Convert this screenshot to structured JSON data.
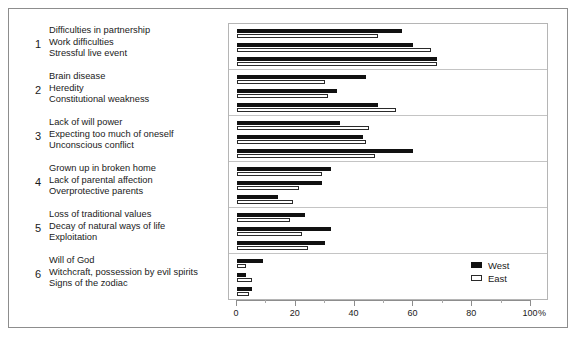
{
  "chart_data": {
    "type": "bar",
    "orientation": "horizontal",
    "title": "",
    "xlabel": "",
    "ylabel": "",
    "unit": "%",
    "xlim": [
      0,
      100
    ],
    "grid": false,
    "legend_position": "inside-bottom-right",
    "tick_labels": [
      "0",
      "20",
      "40",
      "60",
      "80",
      "100"
    ],
    "tick_values": [
      0,
      20,
      40,
      60,
      80,
      100
    ],
    "minor_tick_values": [
      10,
      30,
      50,
      70,
      90
    ],
    "series": [
      {
        "name": "West",
        "color": "#111111",
        "style": "filled"
      },
      {
        "name": "East",
        "color": "#ffffff",
        "style": "outlined"
      }
    ],
    "groups": [
      {
        "number": "1",
        "categories": [
          {
            "label": "Difficulties in partnership",
            "West": 56,
            "East": 48
          },
          {
            "label": "Work difficulties",
            "West": 60,
            "East": 66
          },
          {
            "label": "Stressful live event",
            "West": 68,
            "East": 68
          }
        ]
      },
      {
        "number": "2",
        "categories": [
          {
            "label": "Brain disease",
            "West": 44,
            "East": 30
          },
          {
            "label": "Heredity",
            "West": 34,
            "East": 31
          },
          {
            "label": "Constitutional weakness",
            "West": 48,
            "East": 54
          }
        ]
      },
      {
        "number": "3",
        "categories": [
          {
            "label": "Lack of will power",
            "West": 35,
            "East": 45
          },
          {
            "label": "Expecting too much of oneself",
            "West": 43,
            "East": 44
          },
          {
            "label": "Unconscious conflict",
            "West": 60,
            "East": 47
          }
        ]
      },
      {
        "number": "4",
        "categories": [
          {
            "label": "Grown up in broken home",
            "West": 32,
            "East": 29
          },
          {
            "label": "Lack of parental affection",
            "West": 29,
            "East": 21
          },
          {
            "label": "Overprotective parents",
            "West": 14,
            "East": 19
          }
        ]
      },
      {
        "number": "5",
        "categories": [
          {
            "label": "Loss of traditional values",
            "West": 23,
            "East": 18
          },
          {
            "label": "Decay of natural ways of life",
            "West": 32,
            "East": 22
          },
          {
            "label": "Exploitation",
            "West": 30,
            "East": 24
          }
        ]
      },
      {
        "number": "6",
        "categories": [
          {
            "label": "Will of God",
            "West": 9,
            "East": 3
          },
          {
            "label": "Witchcraft, possession by evil spirits",
            "West": 3,
            "East": 5
          },
          {
            "label": "Signs of the zodiac",
            "West": 5,
            "East": 4
          }
        ]
      }
    ]
  },
  "legend": {
    "items": [
      {
        "label": "West"
      },
      {
        "label": "East"
      }
    ]
  },
  "axis": {
    "unit_label": "%"
  }
}
